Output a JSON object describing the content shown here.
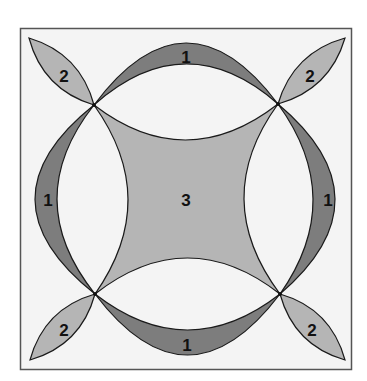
{
  "diagram": {
    "title": "",
    "colors": {
      "background": "#ffffff",
      "frame_fill": "#f4f4f4",
      "frame_stroke": "#555555",
      "band": "#7d7d7d",
      "light": "#b5b5b5",
      "outline": "#1a1a1a"
    },
    "regions": [
      {
        "id": "band-top",
        "label": "1",
        "shade": "dark"
      },
      {
        "id": "band-left",
        "label": "1",
        "shade": "dark"
      },
      {
        "id": "band-right",
        "label": "1",
        "shade": "dark"
      },
      {
        "id": "band-bottom",
        "label": "1",
        "shade": "dark"
      },
      {
        "id": "petal-top-left",
        "label": "2",
        "shade": "light"
      },
      {
        "id": "petal-top-right",
        "label": "2",
        "shade": "light"
      },
      {
        "id": "petal-bottom-left",
        "label": "2",
        "shade": "light"
      },
      {
        "id": "petal-bottom-right",
        "label": "2",
        "shade": "light"
      },
      {
        "id": "center",
        "label": "3",
        "shade": "light"
      }
    ],
    "labels": {
      "band_top": "1",
      "band_left": "1",
      "band_right": "1",
      "band_bottom": "1",
      "petal_tl": "2",
      "petal_tr": "2",
      "petal_bl": "2",
      "petal_br": "2",
      "center": "3"
    }
  }
}
